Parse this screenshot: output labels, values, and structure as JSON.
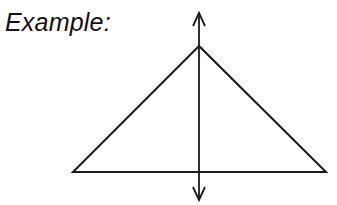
{
  "title": "Example:",
  "diagram": {
    "shape": "isosceles triangle with vertical line of symmetry",
    "triangle": {
      "apex": [
        199,
        46
      ],
      "base_left": [
        73,
        172
      ],
      "base_right": [
        326,
        172
      ]
    },
    "symmetry_line": {
      "x": 199,
      "top": 12,
      "bottom": 200,
      "arrowheads": [
        "top",
        "bottom"
      ]
    },
    "stroke_color": "#1a1a1a"
  }
}
